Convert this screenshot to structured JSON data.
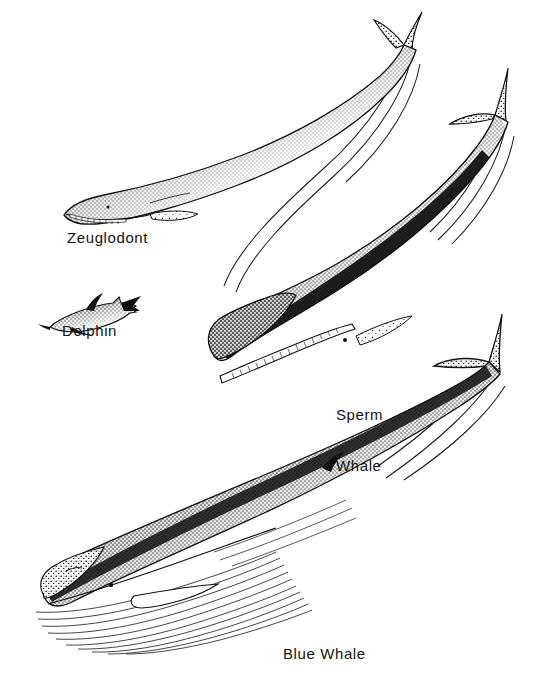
{
  "figure": {
    "kind": "scientific-illustration",
    "background_color": "#ffffff",
    "ink_color": "#111111",
    "width": 553,
    "height": 677
  },
  "labels": {
    "zeuglodont": "Zeuglodont",
    "dolphin": "Dolphin",
    "sperm_line1": "Sperm",
    "sperm_line2": "Whale",
    "blue": "Blue Whale"
  },
  "specimens": [
    {
      "id": "zeuglodont",
      "label": "Zeuglodont",
      "description": "long slender archaeocete whale, head lower-left, notched tail flukes upper-right, stippled dorsal shading, toothed jaw, small pectoral flipper",
      "relative_size": "small-medium"
    },
    {
      "id": "dolphin",
      "label": "Dolphin",
      "description": "smallest figure, beaked head pointing left, falcate dorsal fin, swept tail flukes at right",
      "relative_size": "smallest"
    },
    {
      "id": "sperm-whale",
      "label": "Sperm Whale",
      "description": "massive blunt squared head at lower-left, dark heavily stippled body, narrow toothed lower jaw, knuckled dorsal ridge, broad triangular flukes upper-right",
      "relative_size": "large"
    },
    {
      "id": "blue-whale",
      "label": "Blue Whale",
      "description": "largest figure, long tapering body, rostrum and eye lower-left, many ventral throat pleats, long pectoral flipper, small far-back dorsal fin, broad flukes at right",
      "relative_size": "largest"
    }
  ]
}
